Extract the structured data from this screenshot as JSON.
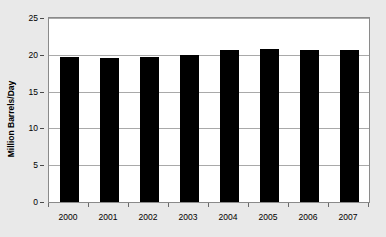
{
  "chart_data": {
    "type": "bar",
    "title": "",
    "xlabel": "",
    "ylabel": "Million Barrels/Day",
    "categories": [
      "2000",
      "2001",
      "2002",
      "2003",
      "2004",
      "2005",
      "2006",
      "2007"
    ],
    "values": [
      19.7,
      19.6,
      19.7,
      19.95,
      20.7,
      20.8,
      20.7,
      20.7
    ],
    "series": [
      {
        "name": "Consumption",
        "values": [
          19.7,
          19.6,
          19.7,
          19.95,
          20.7,
          20.8,
          20.7,
          20.7
        ]
      }
    ],
    "ylim": [
      0,
      25
    ],
    "yticks": [
      0,
      5,
      10,
      15,
      20,
      25
    ],
    "ytick_labels": [
      "0",
      "5",
      "10",
      "15",
      "20",
      "25"
    ],
    "grid": true,
    "grid_axis": "y",
    "legend": false,
    "legend_position": "none",
    "bar_color": "#000000",
    "plot_background": "#ffffff",
    "figure_background": "#e9e9e9",
    "gridline_color": "#a9a9a9",
    "frame_color": "#8a8a8a"
  }
}
